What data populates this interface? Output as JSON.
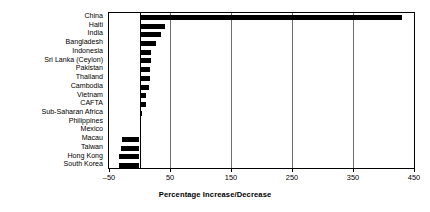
{
  "chart_data": {
    "type": "bar",
    "orientation": "horizontal",
    "title": "",
    "xlabel": "Percentage Increase/Decrease",
    "ylabel": "",
    "xlim": [
      -50,
      450
    ],
    "xticks": [
      -50,
      50,
      150,
      250,
      350,
      450
    ],
    "xtick_labels": [
      "–50",
      "50",
      "150",
      "250",
      "350",
      "450"
    ],
    "grid": true,
    "legend": false,
    "zero_line": true,
    "bar_color": "#000000",
    "categories": [
      "China",
      "Haiti",
      "India",
      "Bangladesh",
      "Indonesia",
      "Sri Lanka (Ceylon)",
      "Pakistan",
      "Thailand",
      "Cambodia",
      "Vietnam",
      "CAFTA",
      "Sub-Saharan Africa",
      "Philippines",
      "Mexico",
      "Macau",
      "Taiwan",
      "Hong Kong",
      "South Korea"
    ],
    "values": [
      430,
      42,
      36,
      27,
      19,
      19,
      18,
      17,
      16,
      11,
      10,
      4,
      3,
      3,
      -29,
      -31,
      -34,
      -33
    ]
  }
}
